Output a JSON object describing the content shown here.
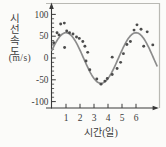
{
  "figure": {
    "bg_color": "#fbfbf9",
    "frame_color": "#b9b9b4",
    "axis_color": "#3a3a3a",
    "curve_color": "#8c8c8c",
    "dot_color": "#4c4c4c",
    "text_color": "#3c3c3c"
  },
  "chart_data": {
    "type": "scatter",
    "title": "",
    "ylabel": "시선 속도",
    "ylabel_stacked": [
      "시",
      "선",
      "속",
      "도"
    ],
    "ylabel_unit": "(m/s)",
    "xlabel": "시간(일)",
    "y_ticks": [
      100,
      50,
      0,
      -50,
      -100
    ],
    "y_minor_tick_step": 10,
    "x_ticks": [
      1,
      2,
      3,
      4,
      5,
      6
    ],
    "ylim": [
      -120,
      120
    ],
    "xlim": [
      0,
      7.7
    ],
    "grid": false,
    "legend": "none",
    "points": [
      [
        0.12,
        35
      ],
      [
        0.36,
        58
      ],
      [
        0.5,
        53
      ],
      [
        0.62,
        78
      ],
      [
        0.88,
        80
      ],
      [
        0.9,
        24
      ],
      [
        1.05,
        62
      ],
      [
        1.25,
        58
      ],
      [
        1.5,
        55
      ],
      [
        1.75,
        48
      ],
      [
        1.95,
        45
      ],
      [
        2.2,
        38
      ],
      [
        2.35,
        27
      ],
      [
        2.43,
        -7
      ],
      [
        2.55,
        13
      ],
      [
        2.7,
        -27
      ],
      [
        3.2,
        -48
      ],
      [
        3.5,
        -60
      ],
      [
        3.78,
        -53
      ],
      [
        3.95,
        -47
      ],
      [
        4.3,
        -38
      ],
      [
        4.3,
        2
      ],
      [
        4.65,
        -24
      ],
      [
        4.9,
        -10
      ],
      [
        5.1,
        10
      ],
      [
        5.35,
        31
      ],
      [
        5.6,
        38
      ],
      [
        5.86,
        64
      ],
      [
        6.07,
        76
      ],
      [
        6.36,
        66
      ],
      [
        6.55,
        27
      ],
      [
        6.8,
        60
      ],
      [
        7.2,
        30
      ]
    ],
    "fit_curve": {
      "type": "sinusoid",
      "amplitude_ms": 58,
      "period_days": 5,
      "peak_day": 1.0,
      "mean_ms": 0,
      "t_start": 0,
      "t_end": 7.55
    }
  }
}
